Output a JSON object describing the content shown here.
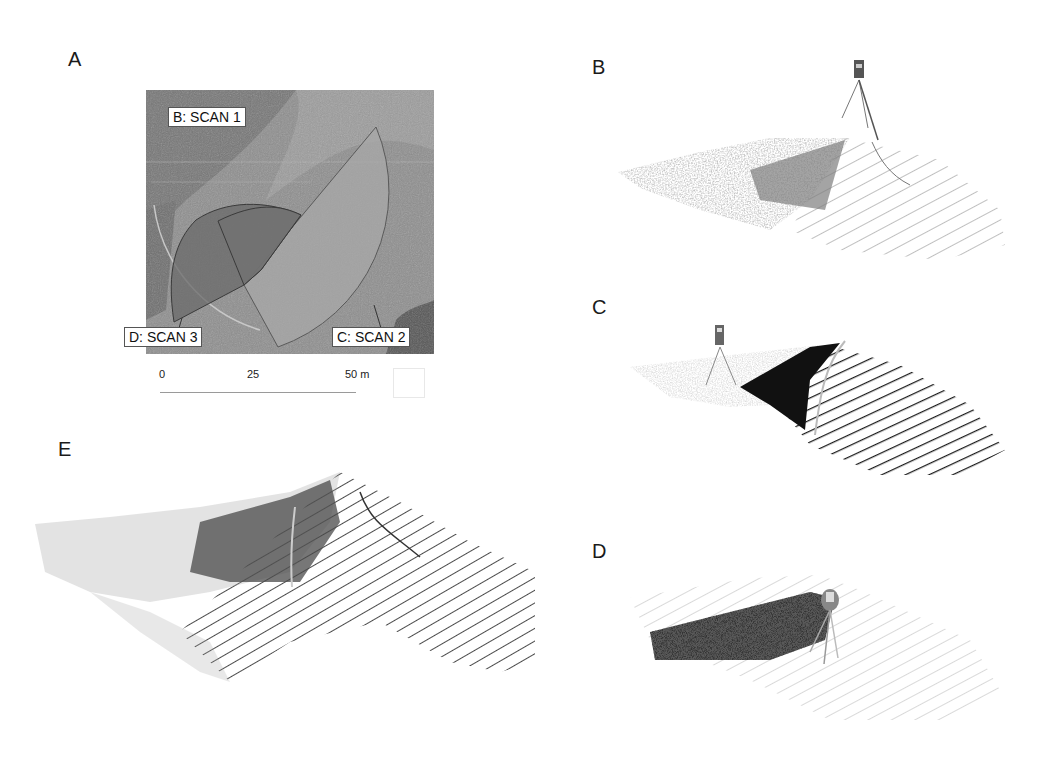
{
  "panels": {
    "a": {
      "letter": "A",
      "labels": {
        "scan1": "B: SCAN 1",
        "scan2": "C: SCAN 2",
        "scan3": "D: SCAN 3"
      },
      "scale_bar": {
        "tick0": "0",
        "tick1": "25",
        "tick2": "50 m"
      }
    },
    "b": {
      "letter": "B"
    },
    "c": {
      "letter": "C"
    },
    "d": {
      "letter": "D"
    },
    "e": {
      "letter": "E"
    }
  },
  "colors": {
    "map_base": "#8c8c8c",
    "map_dark": "#6f6f6f",
    "scan2_fill": "#a3a3a3",
    "scan3_fill": "#6a6a6a",
    "scan1_fill": "#7a7a7a",
    "cloud_light": "#b8b8b8",
    "cloud_mid": "#8a8a8a",
    "cloud_dark": "#1e1e1e"
  }
}
